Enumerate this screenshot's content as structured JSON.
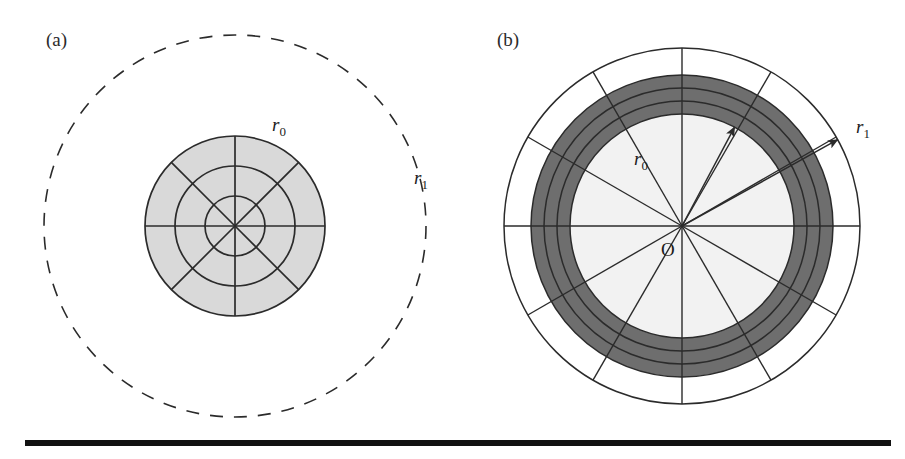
{
  "figure": {
    "background_color": "#ffffff",
    "stroke_color": "#2b2b2b",
    "panels": [
      {
        "tag": "(a)",
        "tag_x": 46,
        "tag_y": 46,
        "center_x": 235,
        "center_y": 226,
        "inner_fill": "#d9d9d9",
        "outer_style": "dashed",
        "r0": 90,
        "r1": 191,
        "ring_radii": [
          30,
          60,
          90
        ],
        "spoke_count": 8,
        "spoke_offset_deg": 0,
        "labels": [
          {
            "name": "r0",
            "base": "r",
            "sub": "0",
            "x": 272,
            "y": 131
          },
          {
            "name": "r1",
            "base": "r",
            "sub": "1",
            "x": 414,
            "y": 184
          }
        ]
      },
      {
        "tag": "(b)",
        "tag_x": 497,
        "tag_y": 46,
        "center_x": 682,
        "center_y": 226,
        "inner_fill": "#f2f2f2",
        "band_fill": "#6e6e6e",
        "outer_style": "solid",
        "r0": 112,
        "r1": 178,
        "band_radii": [
          112,
          125,
          138,
          151
        ],
        "spoke_count": 12,
        "spoke_offset_deg": 0,
        "labels": [
          {
            "name": "r0",
            "base": "r",
            "sub": "0",
            "x": 634,
            "y": 165
          },
          {
            "name": "r1",
            "base": "r",
            "sub": "1",
            "x": 856,
            "y": 133
          },
          {
            "name": "origin",
            "base": "O",
            "sub": "",
            "x": 661,
            "y": 256
          }
        ],
        "arrows": [
          {
            "name": "r0-arrow",
            "angle_deg": 62,
            "length": 112
          },
          {
            "name": "r1-arrow",
            "angle_deg": 29,
            "length": 178
          }
        ]
      }
    ],
    "rule": {
      "x": 25,
      "y": 440,
      "width": 866,
      "height": 6,
      "color": "#111111"
    }
  },
  "chart_data": {
    "type": "diagram",
    "panels": [
      {
        "label": "(a)",
        "inner_radius_label": "r0",
        "outer_radius_label": "r1",
        "inner_radius_px": 90,
        "outer_radius_px": 191,
        "concentric_circles_px": [
          30,
          60,
          90
        ],
        "radial_spokes": 8,
        "shaded_region": "disk of radius r0",
        "outer_boundary": "dashed"
      },
      {
        "label": "(b)",
        "inner_radius_label": "r0",
        "outer_radius_label": "r1",
        "inner_radius_px": 112,
        "outer_radius_px": 178,
        "concentric_circles_px": [
          112,
          125,
          138,
          151,
          178
        ],
        "radial_spokes": 12,
        "shaded_region": "annulus between r=112 and r=151",
        "outer_boundary": "solid",
        "origin_label": "O"
      }
    ]
  }
}
